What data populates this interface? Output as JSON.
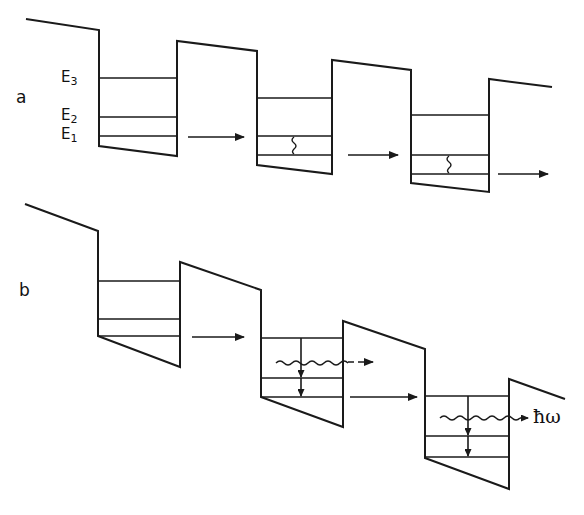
{
  "panels": {
    "a": {
      "label": "a",
      "level_labels": [
        {
          "base": "E",
          "sub": "3"
        },
        {
          "base": "E",
          "sub": "2"
        },
        {
          "base": "E",
          "sub": "1"
        }
      ],
      "description": "Unbiased-to-biased superlattice: electrons tunnel between wells with non-radiative relaxation"
    },
    "b": {
      "label": "b",
      "photon_label": "ħω",
      "description": "Cascade with radiative transitions emitting photons"
    }
  },
  "colors": {
    "line": "#1a1a1a",
    "background": "#ffffff"
  }
}
